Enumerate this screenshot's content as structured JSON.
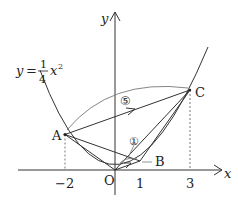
{
  "diagram": {
    "equation": {
      "lhs": "y",
      "eq": "=",
      "num": "1",
      "den": "4",
      "var": "x",
      "exp": "2"
    },
    "axes": {
      "x_label": "x",
      "y_label": "y",
      "origin_label": "O"
    },
    "ticks": [
      {
        "value": -2,
        "label": "−2"
      },
      {
        "value": 1,
        "label": "1"
      },
      {
        "value": 3,
        "label": "3"
      }
    ],
    "points": [
      {
        "name": "A",
        "x": -2,
        "y": 1,
        "label": "A"
      },
      {
        "name": "B",
        "x": 1,
        "y": 0.25,
        "label": "B"
      },
      {
        "name": "C",
        "x": 3,
        "y": 2.25,
        "label": "C"
      }
    ],
    "arc_labels": {
      "big": "⑤",
      "small": "①"
    },
    "colors": {
      "stroke": "#333333",
      "light": "#777777"
    }
  }
}
